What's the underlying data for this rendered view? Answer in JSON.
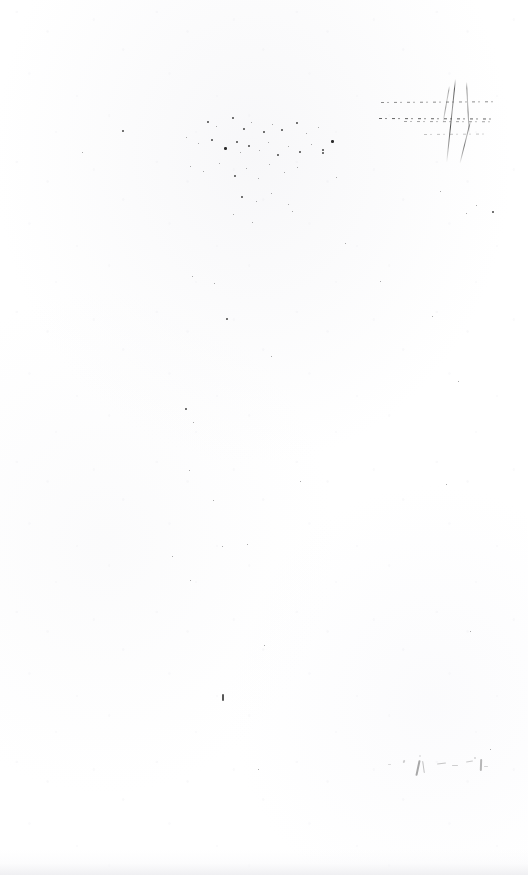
{
  "page": {
    "kind": "scanned-document-page",
    "condition": "faded",
    "width": 528,
    "height": 875,
    "background_color": "#ffffff",
    "paper_tone_color": "#fefefe",
    "ink_color": "#2b2b2b",
    "description": "Severely faded scanned document page; no legible text remains, only scanning artifacts, dust specks and residual ink strokes.",
    "legible_text": ""
  },
  "artifacts": {
    "crossed_mark": {
      "name": "crossed-strikethrough-mark",
      "description": "Broken horizontal ruled lines crossed by two near-vertical diagonal strokes, upper right of page.",
      "bounds": {
        "x": 378,
        "y": 78,
        "width": 117,
        "height": 87
      },
      "rules": [
        {
          "x": 381,
          "y": 102,
          "width": 112,
          "rotate": -0.4,
          "opacity": 0.62
        },
        {
          "x": 379,
          "y": 118,
          "width": 114,
          "rotate": 0.3,
          "opacity": 0.85
        },
        {
          "x": 404,
          "y": 121,
          "width": 88,
          "rotate": 0.2,
          "opacity": 0.5
        },
        {
          "x": 424,
          "y": 134,
          "width": 64,
          "rotate": -0.5,
          "opacity": 0.32
        }
      ],
      "strokes": [
        {
          "x": 455,
          "y": 79,
          "length": 84,
          "rotate": 6,
          "opacity": 0.9
        },
        {
          "x": 466,
          "y": 82,
          "length": 52,
          "rotate": -3,
          "opacity": 0.62
        },
        {
          "x": 449,
          "y": 86,
          "length": 38,
          "rotate": 10,
          "opacity": 0.5
        },
        {
          "x": 470,
          "y": 121,
          "length": 44,
          "rotate": 14,
          "opacity": 0.7
        }
      ]
    },
    "speck_cluster": {
      "name": "dust-speckle-cluster",
      "description": "Dense scattered dust and noise specks across the upper middle of the page.",
      "bounds": {
        "x": 176,
        "y": 112,
        "width": 168,
        "height": 120
      },
      "specks": [
        {
          "x": 207,
          "y": 121,
          "size": 2
        },
        {
          "x": 216,
          "y": 126,
          "size": 1
        },
        {
          "x": 232,
          "y": 117,
          "size": 2
        },
        {
          "x": 243,
          "y": 128,
          "size": 2
        },
        {
          "x": 251,
          "y": 122,
          "size": 1
        },
        {
          "x": 263,
          "y": 131,
          "size": 2
        },
        {
          "x": 272,
          "y": 124,
          "size": 1
        },
        {
          "x": 281,
          "y": 129,
          "size": 2
        },
        {
          "x": 296,
          "y": 122,
          "size": 2
        },
        {
          "x": 306,
          "y": 133,
          "size": 1
        },
        {
          "x": 318,
          "y": 127,
          "size": 1
        },
        {
          "x": 186,
          "y": 137,
          "size": 1
        },
        {
          "x": 198,
          "y": 143,
          "size": 1
        },
        {
          "x": 211,
          "y": 139,
          "size": 2
        },
        {
          "x": 224,
          "y": 147,
          "size": 3
        },
        {
          "x": 236,
          "y": 141,
          "size": 2
        },
        {
          "x": 240,
          "y": 152,
          "size": 1
        },
        {
          "x": 248,
          "y": 145,
          "size": 2
        },
        {
          "x": 259,
          "y": 150,
          "size": 1
        },
        {
          "x": 268,
          "y": 142,
          "size": 1
        },
        {
          "x": 277,
          "y": 154,
          "size": 2
        },
        {
          "x": 288,
          "y": 146,
          "size": 1
        },
        {
          "x": 299,
          "y": 151,
          "size": 2
        },
        {
          "x": 311,
          "y": 144,
          "size": 1
        },
        {
          "x": 322,
          "y": 149,
          "size": 2
        },
        {
          "x": 331,
          "y": 140,
          "size": 3
        },
        {
          "x": 190,
          "y": 166,
          "size": 1
        },
        {
          "x": 203,
          "y": 171,
          "size": 1
        },
        {
          "x": 219,
          "y": 163,
          "size": 1
        },
        {
          "x": 234,
          "y": 175,
          "size": 2
        },
        {
          "x": 246,
          "y": 168,
          "size": 1
        },
        {
          "x": 258,
          "y": 178,
          "size": 1
        },
        {
          "x": 269,
          "y": 164,
          "size": 1
        },
        {
          "x": 284,
          "y": 172,
          "size": 1
        },
        {
          "x": 297,
          "y": 167,
          "size": 1
        },
        {
          "x": 241,
          "y": 196,
          "size": 2
        },
        {
          "x": 256,
          "y": 201,
          "size": 1
        },
        {
          "x": 271,
          "y": 193,
          "size": 1
        },
        {
          "x": 288,
          "y": 204,
          "size": 1
        },
        {
          "x": 233,
          "y": 214,
          "size": 1
        },
        {
          "x": 252,
          "y": 222,
          "size": 1
        },
        {
          "x": 292,
          "y": 211,
          "size": 1
        }
      ]
    },
    "scattered_specks": {
      "name": "scattered-dust-specks",
      "description": "Isolated dust specks spread sparsely over the rest of the sheet.",
      "specks": [
        {
          "x": 122,
          "y": 130,
          "size": 2
        },
        {
          "x": 82,
          "y": 152,
          "size": 1
        },
        {
          "x": 322,
          "y": 152,
          "size": 2
        },
        {
          "x": 336,
          "y": 177,
          "size": 1
        },
        {
          "x": 440,
          "y": 191,
          "size": 1
        },
        {
          "x": 476,
          "y": 205,
          "size": 1
        },
        {
          "x": 492,
          "y": 211,
          "size": 2
        },
        {
          "x": 466,
          "y": 213,
          "size": 1
        },
        {
          "x": 345,
          "y": 243,
          "size": 1
        },
        {
          "x": 192,
          "y": 276,
          "size": 1
        },
        {
          "x": 214,
          "y": 283,
          "size": 1
        },
        {
          "x": 226,
          "y": 318,
          "size": 2
        },
        {
          "x": 271,
          "y": 356,
          "size": 1
        },
        {
          "x": 380,
          "y": 281,
          "size": 1
        },
        {
          "x": 432,
          "y": 316,
          "size": 1
        },
        {
          "x": 458,
          "y": 381,
          "size": 1
        },
        {
          "x": 185,
          "y": 408,
          "size": 2
        },
        {
          "x": 193,
          "y": 422,
          "size": 1
        },
        {
          "x": 189,
          "y": 470,
          "size": 1
        },
        {
          "x": 300,
          "y": 481,
          "size": 1
        },
        {
          "x": 446,
          "y": 484,
          "size": 1
        },
        {
          "x": 213,
          "y": 500,
          "size": 1
        },
        {
          "x": 222,
          "y": 546,
          "size": 1
        },
        {
          "x": 247,
          "y": 544,
          "size": 1
        },
        {
          "x": 172,
          "y": 556,
          "size": 1
        },
        {
          "x": 190,
          "y": 580,
          "size": 1
        },
        {
          "x": 264,
          "y": 645,
          "size": 1
        },
        {
          "x": 470,
          "y": 631,
          "size": 1
        },
        {
          "x": 490,
          "y": 749,
          "size": 1
        },
        {
          "x": 258,
          "y": 769,
          "size": 1
        }
      ]
    },
    "tick_mark": {
      "name": "residual-tick-mark",
      "description": "Single short vertical ink tick in the lower middle of the page.",
      "x": 222,
      "y": 694,
      "width": 2,
      "height": 7
    },
    "bottom_faint_mark": {
      "name": "faint-illegible-mark",
      "description": "Row of faint illegible residual strokes near the lower right, possibly a vanished signature or line of text.",
      "bounds": {
        "x": 385,
        "y": 750,
        "width": 112,
        "height": 28
      },
      "strokes": [
        {
          "x": 388,
          "y": 764,
          "width": 3,
          "height": 1,
          "rotate": 0,
          "opacity": 0.35
        },
        {
          "x": 403,
          "y": 760,
          "width": 2,
          "height": 3,
          "rotate": 20,
          "opacity": 0.45
        },
        {
          "x": 419,
          "y": 755,
          "width": 2,
          "height": 2,
          "rotate": 0,
          "opacity": 0.3
        },
        {
          "x": 417,
          "y": 760,
          "width": 2,
          "height": 16,
          "rotate": 12,
          "opacity": 0.85
        },
        {
          "x": 423,
          "y": 761,
          "width": 1,
          "height": 12,
          "rotate": -8,
          "opacity": 0.6
        },
        {
          "x": 437,
          "y": 763,
          "width": 9,
          "height": 1,
          "rotate": -6,
          "opacity": 0.55
        },
        {
          "x": 452,
          "y": 765,
          "width": 6,
          "height": 1,
          "rotate": 0,
          "opacity": 0.45
        },
        {
          "x": 466,
          "y": 761,
          "width": 7,
          "height": 1,
          "rotate": -10,
          "opacity": 0.5
        },
        {
          "x": 474,
          "y": 757,
          "width": 2,
          "height": 2,
          "rotate": 0,
          "opacity": 0.4
        },
        {
          "x": 480,
          "y": 759,
          "width": 2,
          "height": 12,
          "rotate": 2,
          "opacity": 0.7
        },
        {
          "x": 484,
          "y": 766,
          "width": 4,
          "height": 1,
          "rotate": 0,
          "opacity": 0.4
        }
      ]
    },
    "bottom_smudge": {
      "name": "bottom-edge-smudge",
      "description": "Very faint grey smudge band along the bottom edge of the scan."
    }
  }
}
